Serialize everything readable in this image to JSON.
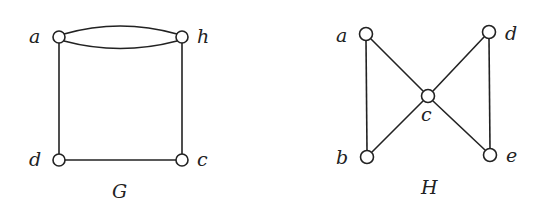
{
  "graphs": [
    {
      "name": "G",
      "vertices": [
        {
          "id": "a",
          "label": "a",
          "x": 59,
          "y": 37
        },
        {
          "id": "h",
          "label": "h",
          "x": 182,
          "y": 37
        },
        {
          "id": "c",
          "label": "c",
          "x": 182,
          "y": 160
        },
        {
          "id": "d",
          "label": "d",
          "x": 59,
          "y": 160
        }
      ],
      "edges": [
        [
          "a",
          "h"
        ],
        [
          "a",
          "h"
        ],
        [
          "a",
          "d"
        ],
        [
          "h",
          "c"
        ],
        [
          "d",
          "c"
        ]
      ]
    },
    {
      "name": "H",
      "vertices": [
        {
          "id": "a",
          "label": "a",
          "x": 366,
          "y": 34
        },
        {
          "id": "b",
          "label": "b",
          "x": 367,
          "y": 157
        },
        {
          "id": "c",
          "label": "c",
          "x": 428,
          "y": 96
        },
        {
          "id": "d",
          "label": "d",
          "x": 489,
          "y": 32
        },
        {
          "id": "e",
          "label": "e",
          "x": 490,
          "y": 155
        }
      ],
      "edges": [
        [
          "a",
          "b"
        ],
        [
          "a",
          "c"
        ],
        [
          "b",
          "c"
        ],
        [
          "c",
          "d"
        ],
        [
          "c",
          "e"
        ],
        [
          "d",
          "e"
        ]
      ]
    }
  ]
}
